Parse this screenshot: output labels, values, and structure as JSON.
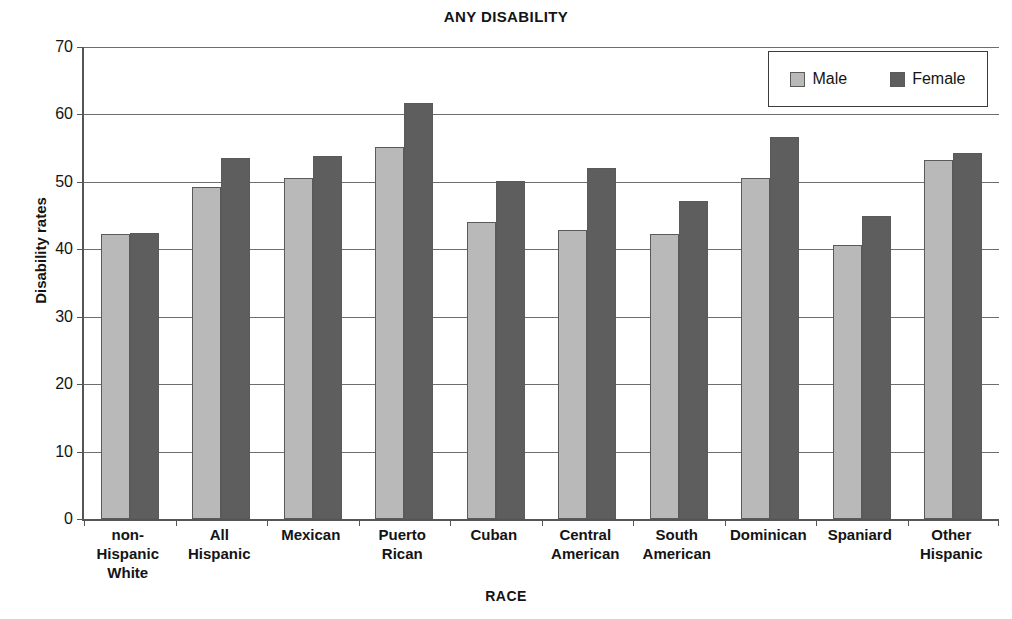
{
  "chart_data": {
    "type": "bar",
    "title": "ANY DISABILITY",
    "xlabel": "RACE",
    "ylabel": "Disability rates",
    "ylim": [
      0,
      70
    ],
    "ytick_step": 10,
    "yticks": [
      70,
      60,
      50,
      40,
      30,
      20,
      10,
      0
    ],
    "grid": true,
    "legend_position": "top-right",
    "categories": [
      "non-\nHispanic\nWhite",
      "All\nHispanic",
      "Mexican",
      "Puerto\nRican",
      "Cuban",
      "Central\nAmerican",
      "South\nAmerican",
      "Dominican",
      "Spaniard",
      "Other\nHispanic"
    ],
    "category_lines": [
      [
        "non-",
        "Hispanic",
        "White"
      ],
      [
        "All",
        "Hispanic"
      ],
      [
        "Mexican"
      ],
      [
        "Puerto",
        "Rican"
      ],
      [
        "Cuban"
      ],
      [
        "Central",
        "American"
      ],
      [
        "South",
        "American"
      ],
      [
        "Dominican"
      ],
      [
        "Spaniard"
      ],
      [
        "Other",
        "Hispanic"
      ]
    ],
    "series": [
      {
        "name": "Male",
        "color": "#b9b9b9",
        "values": [
          42.3,
          49.2,
          50.6,
          55.1,
          44.0,
          42.8,
          42.3,
          50.6,
          40.7,
          53.2
        ]
      },
      {
        "name": "Female",
        "color": "#5e5e5e",
        "values": [
          42.4,
          53.5,
          53.8,
          61.7,
          50.2,
          52.0,
          47.1,
          56.6,
          45.0,
          54.3
        ]
      }
    ]
  },
  "legend": {
    "entries": [
      {
        "label": "Male",
        "swatch": "male-swatch"
      },
      {
        "label": "Female",
        "swatch": "female-swatch"
      }
    ]
  }
}
